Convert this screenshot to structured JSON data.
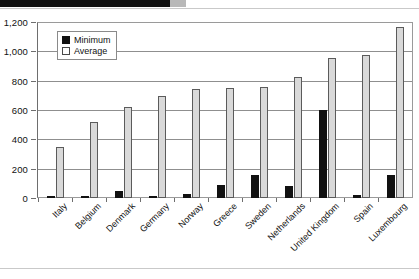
{
  "decor": {
    "top_bar": "black-block",
    "top_chip": "gray-chip"
  },
  "legend": {
    "position": "top-left-inside",
    "items": [
      {
        "label": "Minimum",
        "swatch": "black"
      },
      {
        "label": "Average",
        "swatch": "white"
      }
    ]
  },
  "chart_data": {
    "type": "bar",
    "title": "",
    "subtitle": "",
    "xlabel": "",
    "ylabel": "",
    "ylim": [
      0,
      1200
    ],
    "yticks": [
      "0",
      "200",
      "400",
      "600",
      "800",
      "1,000",
      "1,200"
    ],
    "ytick_values": [
      0,
      200,
      400,
      600,
      800,
      1000,
      1200
    ],
    "grid": true,
    "legend_position": "upper left",
    "categories": [
      "Italy",
      "Belgium",
      "Denmark",
      "Germany",
      "Norway",
      "Greece",
      "Sweden",
      "Netherlands",
      "United Kingdom",
      "Spain",
      "Luxembourg"
    ],
    "series": [
      {
        "name": "Minimum",
        "color": "#111111",
        "values": [
          10,
          5,
          50,
          15,
          30,
          90,
          160,
          85,
          605,
          20,
          155
        ]
      },
      {
        "name": "Average",
        "color": "#d9d9d9",
        "values": [
          350,
          520,
          625,
          700,
          750,
          755,
          760,
          830,
          960,
          980,
          1175
        ]
      }
    ]
  }
}
